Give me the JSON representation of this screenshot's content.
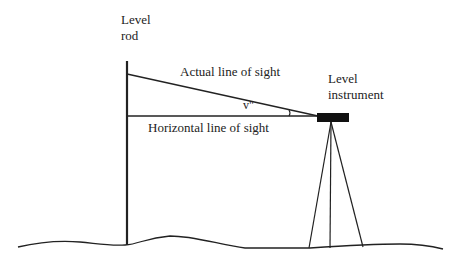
{
  "diagram": {
    "labels": {
      "rod_line1": "Level",
      "rod_line2": "rod",
      "actual_sight": "Actual line of sight",
      "horizontal_sight": "Horizontal line of sight",
      "angle": "v\"",
      "instrument_line1": "Level",
      "instrument_line2": "instrument"
    },
    "colors": {
      "stroke": "#222222",
      "background": "#ffffff"
    }
  }
}
